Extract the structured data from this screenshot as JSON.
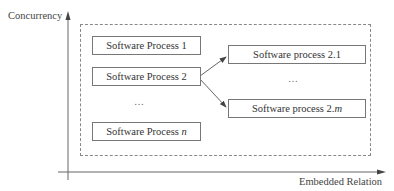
{
  "axes": {
    "y_label": "Concurrency",
    "x_label": "Embedded Relation"
  },
  "left_column": {
    "boxes": [
      {
        "prefix": "Software Process ",
        "suffix": "1",
        "italic_suffix": false
      },
      {
        "prefix": "Software Process ",
        "suffix": "2",
        "italic_suffix": false
      },
      {
        "prefix": "Software Process ",
        "suffix": "n",
        "italic_suffix": true
      }
    ],
    "ellipsis": "…"
  },
  "right_column": {
    "boxes": [
      {
        "prefix": "Software process ",
        "suffix": "2.1",
        "italic_suffix": false
      },
      {
        "prefix": "Software process 2.",
        "suffix": "m",
        "italic_suffix": true
      }
    ],
    "ellipsis": "…"
  },
  "arrows": [
    {
      "from": "Software Process 2",
      "to": "Software process 2.1"
    },
    {
      "from": "Software Process 2",
      "to": "Software process 2.m"
    }
  ],
  "colors": {
    "line": "#555555",
    "box_border": "#777777",
    "dashed_border": "#888888"
  }
}
